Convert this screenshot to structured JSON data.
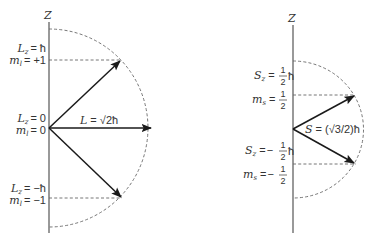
{
  "orbital": {
    "axis_label": "Z",
    "vector_label": {
      "symbol": "L",
      "eq": " = ",
      "value": "√2ħ"
    },
    "states": [
      {
        "lz_symbol": "L",
        "lz_sub": "z",
        "lz_value": "= ħ",
        "m_symbol": "m",
        "m_sub": "l",
        "m_value": "= +1"
      },
      {
        "lz_symbol": "L",
        "lz_sub": "z",
        "lz_value": "= 0",
        "m_symbol": "m",
        "m_sub": "l",
        "m_value": "= 0"
      },
      {
        "lz_symbol": "L",
        "lz_sub": "z",
        "lz_value": "= −ħ",
        "m_symbol": "m",
        "m_sub": "l",
        "m_value": "= −1"
      }
    ]
  },
  "spin": {
    "axis_label": "Z",
    "vector_label": {
      "symbol": "S",
      "eq": " = ",
      "value": "(√3/2)ħ"
    },
    "states": [
      {
        "sz_symbol": "S",
        "sz_sub": "z",
        "sz_eq": "=",
        "sz_sign": "",
        "frac_num": "1",
        "frac_den": "2",
        "hbar": "ħ",
        "m_symbol": "m",
        "m_sub": "s",
        "m_eq": "=",
        "m_sign": "",
        "m_num": "1",
        "m_den": "2"
      },
      {
        "sz_symbol": "S",
        "sz_sub": "z",
        "sz_eq": "=",
        "sz_sign": "−",
        "frac_num": "1",
        "frac_den": "2",
        "hbar": "ħ",
        "m_symbol": "m",
        "m_sub": "s",
        "m_eq": "=",
        "m_sign": "−",
        "m_num": "1",
        "m_den": "2"
      }
    ]
  },
  "colors": {
    "vector": "#1a1a1a",
    "axis": "#555555",
    "dashed": "#666666",
    "text": "#333333"
  }
}
